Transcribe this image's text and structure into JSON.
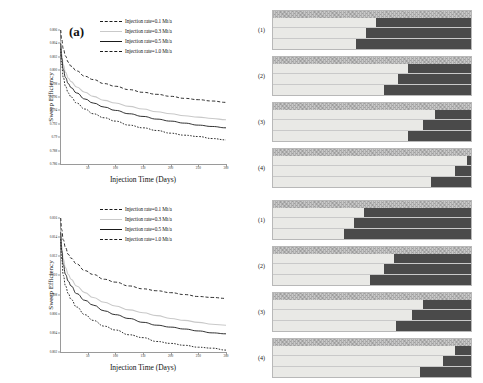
{
  "figure": {
    "panel_a_label": "(a)",
    "panel_b_label": "(b)"
  },
  "legend": {
    "entries": [
      {
        "label": "Injection rate=0.1 Mt/a",
        "style": "long-dash",
        "color": "#1a1a1a"
      },
      {
        "label": "Injection rate=0.3 Mt/a",
        "style": "solid",
        "color": "#c9c9c9"
      },
      {
        "label": "Injection rate=0.5 Mt/a",
        "style": "solid",
        "color": "#1a1a1a"
      },
      {
        "label": "Injection rate=1.0 Mt/a",
        "style": "short-dash",
        "color": "#1a1a1a"
      }
    ]
  },
  "sections": {
    "tags": [
      "(1)",
      "(2)",
      "(3)",
      "(4)"
    ],
    "top_group_fronts_pct": [
      [
        52,
        47,
        42
      ],
      [
        68,
        63,
        56
      ],
      [
        82,
        76,
        68
      ],
      [
        98,
        92,
        80
      ]
    ],
    "bottom_group_fronts_pct": [
      [
        46,
        41,
        36
      ],
      [
        61,
        56,
        49
      ],
      [
        76,
        70,
        62
      ],
      [
        92,
        86,
        74
      ]
    ],
    "caprock_color": "#c8c8c8",
    "swept_color": "#e9e9e6",
    "unswept_color": "#4a4a4a"
  },
  "chart_data": [
    {
      "type": "line",
      "title": "(a)",
      "xlabel": "Injection Time (Days)",
      "ylabel": "Sweep Efficiency",
      "xlim": [
        0,
        300
      ],
      "ylim": [
        0.786,
        0.806
      ],
      "xticks": [
        0,
        50,
        100,
        150,
        200,
        250,
        300
      ],
      "yticks": [
        0.786,
        0.788,
        0.79,
        0.792,
        0.794,
        0.796,
        0.798,
        0.8,
        0.802,
        0.804,
        0.806
      ],
      "grid": false,
      "legend_position": "upper right",
      "x": [
        1,
        3,
        6,
        10,
        15,
        20,
        30,
        45,
        60,
        80,
        100,
        125,
        150,
        175,
        200,
        225,
        250,
        275,
        300
      ],
      "series": [
        {
          "name": "Injection rate=0.1 Mt/a",
          "style": "long-dash",
          "color": "#1a1a1a",
          "values": [
            0.806,
            0.8046,
            0.8032,
            0.8021,
            0.8012,
            0.8006,
            0.7999,
            0.7991,
            0.7986,
            0.798,
            0.7976,
            0.7971,
            0.7967,
            0.7964,
            0.7961,
            0.7958,
            0.7956,
            0.7954,
            0.7952
          ]
        },
        {
          "name": "Injection rate=0.3 Mt/a",
          "style": "solid",
          "color": "#c9c9c9",
          "values": [
            0.8044,
            0.8024,
            0.8008,
            0.7997,
            0.7988,
            0.7983,
            0.7975,
            0.7967,
            0.7961,
            0.7955,
            0.7951,
            0.7946,
            0.7942,
            0.7938,
            0.7935,
            0.7932,
            0.793,
            0.7928,
            0.7926
          ]
        },
        {
          "name": "Injection rate=0.5 Mt/a",
          "style": "solid",
          "color": "#1a1a1a",
          "values": [
            0.804,
            0.8018,
            0.8001,
            0.7989,
            0.798,
            0.7974,
            0.7966,
            0.7957,
            0.7951,
            0.7945,
            0.794,
            0.7935,
            0.7931,
            0.7927,
            0.7924,
            0.7921,
            0.7918,
            0.7916,
            0.7914
          ]
        },
        {
          "name": "Injection rate=1.0 Mt/a",
          "style": "short-dash",
          "color": "#1a1a1a",
          "values": [
            0.8032,
            0.8008,
            0.7989,
            0.7976,
            0.7966,
            0.796,
            0.7951,
            0.7942,
            0.7935,
            0.7929,
            0.7924,
            0.7918,
            0.7914,
            0.791,
            0.7906,
            0.7903,
            0.7901,
            0.7898,
            0.7896
          ]
        }
      ]
    },
    {
      "type": "line",
      "title": "(b)",
      "xlabel": "Injection Time  (Days)",
      "ylabel": "Sweep Efficiency",
      "xlim": [
        0,
        300
      ],
      "ylim": [
        0.802,
        0.816
      ],
      "xticks": [
        0,
        50,
        100,
        150,
        200,
        250,
        300
      ],
      "yticks": [
        0.802,
        0.804,
        0.806,
        0.808,
        0.81,
        0.812,
        0.814,
        0.816
      ],
      "grid": false,
      "legend_position": "upper right",
      "x": [
        1,
        3,
        6,
        10,
        15,
        20,
        30,
        45,
        60,
        80,
        100,
        125,
        150,
        175,
        200,
        225,
        250,
        275,
        300
      ],
      "series": [
        {
          "name": "Injection rate=0.1 Mt/a",
          "style": "long-dash",
          "color": "#1a1a1a",
          "values": [
            0.816,
            0.8148,
            0.8137,
            0.8129,
            0.8122,
            0.8118,
            0.8112,
            0.8105,
            0.8101,
            0.8096,
            0.8093,
            0.8089,
            0.8086,
            0.8084,
            0.8082,
            0.808,
            0.8078,
            0.8077,
            0.8076
          ]
        },
        {
          "name": "Injection rate=0.3 Mt/a",
          "style": "solid",
          "color": "#c9c9c9",
          "values": [
            0.8148,
            0.8131,
            0.8117,
            0.8108,
            0.8101,
            0.8096,
            0.8089,
            0.8082,
            0.8077,
            0.8072,
            0.8068,
            0.8064,
            0.8061,
            0.8058,
            0.8055,
            0.8053,
            0.8051,
            0.8049,
            0.8048
          ]
        },
        {
          "name": "Injection rate=0.5 Mt/a",
          "style": "solid",
          "color": "#1a1a1a",
          "values": [
            0.8145,
            0.8126,
            0.8111,
            0.8101,
            0.8094,
            0.8089,
            0.8081,
            0.8074,
            0.8069,
            0.8063,
            0.8059,
            0.8055,
            0.8051,
            0.8048,
            0.8046,
            0.8044,
            0.8042,
            0.804,
            0.8039
          ]
        },
        {
          "name": "Injection rate=1.0 Mt/a",
          "style": "short-dash",
          "color": "#1a1a1a",
          "values": [
            0.8138,
            0.8117,
            0.81,
            0.8089,
            0.8081,
            0.8075,
            0.8067,
            0.8059,
            0.8053,
            0.8047,
            0.8043,
            0.8038,
            0.8035,
            0.8031,
            0.8029,
            0.8027,
            0.8025,
            0.8024,
            0.8022
          ]
        }
      ]
    }
  ]
}
